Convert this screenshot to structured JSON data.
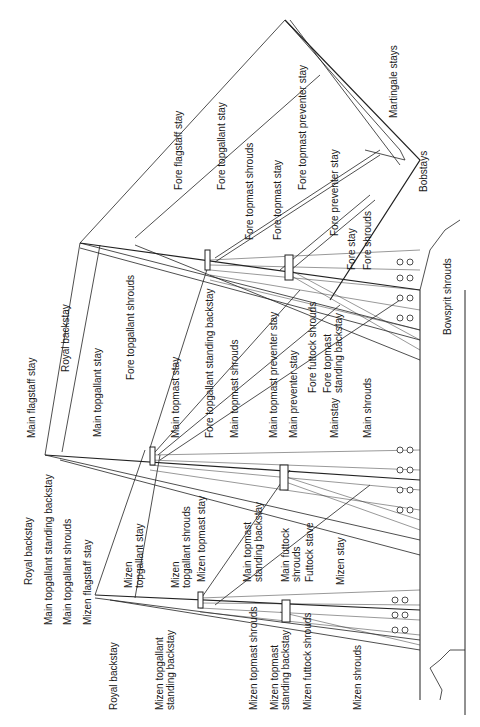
{
  "diagram": {
    "orientation": "rotated 90 degrees counter-clockwise (bow at top)",
    "labels": {
      "fore_flagstaff_stay": "Fore flagstaff stay",
      "fore_topgallant_stay": "Fore topgallant stay",
      "fore_topmast_preventer_stay": "Fore topmast preventer stay",
      "martingale_stays": "Martingale stays",
      "fore_topmast_shrouds": "Fore topmast shrouds",
      "fore_topmast_stay": "Fore topmast stay",
      "fore_preventer_stay": "Fore preventer stay",
      "fore_stay": "Fore stay",
      "fore_shrouds": "Fore shrouds",
      "bobstays": "Bobstays",
      "bowsprit_shrouds": "Bowsprit shrouds",
      "main_flagstaff_stay": "Main flagstaff stay",
      "royal_backstay_top": "Royal backstay",
      "main_topgallant_stay": "Main topgallant stay",
      "fore_topgallant_shrouds": "Fore topgallant shrouds",
      "main_topmast_stay": "Main topmast stay",
      "fore_topgallant_standing_backstay": "Fore topgallant  standing backstay",
      "main_topmast_shrouds": "Main topmast shrouds",
      "main_topmast_preventer_stay": "Main topmast  preventer stay",
      "main_preventer_stay": "Main preventer stay",
      "fore_futtock_shrouds": "Fore futtock shrouds",
      "fore_topmast_standing_backstay_1": "Fore topmast",
      "fore_topmast_standing_backstay_2": "standing backstay",
      "mainstay": "Mainstay",
      "main_shrouds": "Main shrouds",
      "royal_backstay_main": "Royal backstay",
      "main_topgallant_standing_backstay": "Main  topgallant standing backstay",
      "main_topgallant_shrouds": "Main topgallant shrouds",
      "mizen_flagstaff_stay": "Mizen flagstaff stay",
      "mizen_topgallant_stay_1": "Mizen",
      "mizen_topgallant_stay_2": "topgallant stay",
      "mizen_topgallant_shrouds_1": "Mizen",
      "mizen_topgallant_shrouds_2": "topgallant  shrouds",
      "mizen_topmast_stay": "Mizen topmast  stay",
      "main_topmast_standing_backstay_1": "Main topmast",
      "main_topmast_standing_backstay_2": "standing backstay",
      "main_futtock_shrouds_1": "Main futtock",
      "main_futtock_shrouds_2": "shrouds",
      "futtock_stave": "Futtock stave",
      "mizen_stay": "Mizen stay",
      "royal_backstay_mizen": "Royal backstay",
      "mizen_topgallant_standing_backstay_1": "Mizen topgallant",
      "mizen_topgallant_standing_backstay_2": "standing backstay",
      "mizen_topmast_shrouds": "Mizen topmast shrouds",
      "mizen_topmast_standing_backstay_1": "Mizen topmast",
      "mizen_topmast_standing_backstay_2": "standing backstay",
      "mizen_futtock_shrouds": "Mizen futtock shrouds",
      "mizen_shrouds": "Mizen shrouds"
    }
  }
}
